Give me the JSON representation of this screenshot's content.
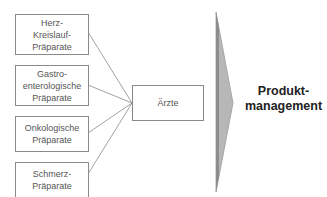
{
  "diagram": {
    "sources": [
      {
        "label": "Herz-\nKreislauf-\nPräparate"
      },
      {
        "label": "Gastro-\nenterologische\nPräparate"
      },
      {
        "label": "Onkologische\nPräparate"
      },
      {
        "label": "Schmerz-\nPräparate"
      }
    ],
    "target": {
      "label": "Ärzte"
    },
    "result": {
      "label": "Produkt-\nmanagement"
    },
    "colors": {
      "line": "#8a8a8a",
      "arrow_fill": "#b5b5b5",
      "arrow_edge": "#8f8f8f"
    }
  }
}
